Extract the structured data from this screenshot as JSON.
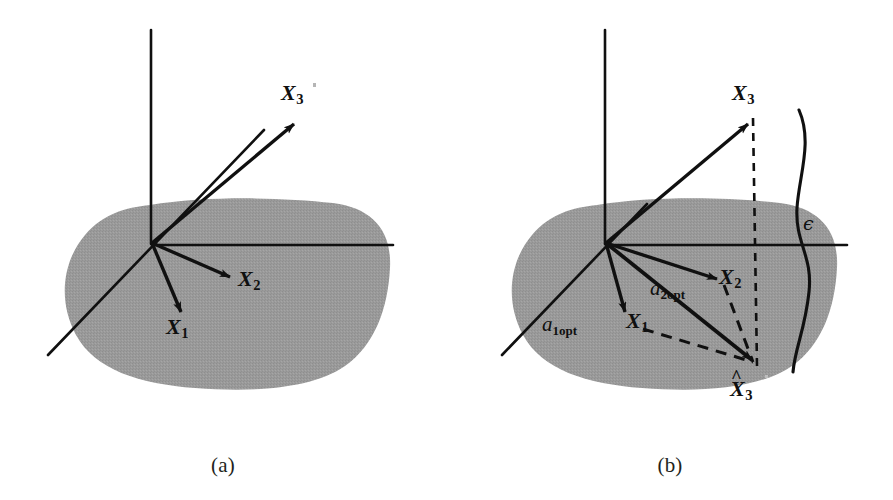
{
  "figure": {
    "background_color": "#ffffff",
    "ink_color": "#101010",
    "subspace_fill_color": "#9a9a9a"
  },
  "panels": [
    {
      "id": "a",
      "caption": "(a)",
      "labels": {
        "x1": "X",
        "x1_sub": "1",
        "x2": "X",
        "x2_sub": "2",
        "x3": "X",
        "x3_sub": "3"
      }
    },
    {
      "id": "b",
      "caption": "(b)",
      "labels": {
        "x1": "X",
        "x1_sub": "1",
        "x2": "X",
        "x2_sub": "2",
        "x3": "X",
        "x3_sub": "3",
        "x3_hat": "X",
        "x3_hat_sub": "3",
        "hat_glyph": "^",
        "a1_coef": "a",
        "a1_sub": "1opt",
        "a2_coef": "a",
        "a2_sub": "2opt",
        "epsilon": "ϵ"
      }
    }
  ],
  "geometry": {
    "panel_a": {
      "origin": [
        152,
        243
      ],
      "vertical_axis": [
        [
          151,
          30
        ],
        [
          151,
          243
        ]
      ],
      "horizontal_axis": [
        [
          152,
          245
        ],
        [
          393,
          245
        ]
      ],
      "diagonal_axis": [
        [
          48,
          355
        ],
        [
          262,
          132
        ]
      ],
      "vectors": [
        {
          "name": "X1",
          "from": [
            152,
            243
          ],
          "to": [
            183,
            318
          ]
        },
        {
          "name": "X2",
          "from": [
            152,
            243
          ],
          "to": [
            235,
            279
          ]
        },
        {
          "name": "X3",
          "from": [
            152,
            243
          ],
          "to": [
            298,
            120
          ]
        }
      ],
      "label_positions": {
        "X1": [
          172,
          328
        ],
        "X2": [
          241,
          282
        ],
        "X3": [
          283,
          88
        ]
      }
    },
    "panel_b": {
      "origin": [
        605,
        243
      ],
      "vertical_axis": [
        [
          604,
          30
        ],
        [
          604,
          243
        ]
      ],
      "horizontal_axis": [
        [
          605,
          245
        ],
        [
          846,
          245
        ]
      ],
      "diagonal_axis": [
        [
          501,
          355
        ],
        [
          700,
          148
        ]
      ],
      "vectors": [
        {
          "name": "X1",
          "from": [
            605,
            243
          ],
          "to": [
            625,
            318
          ]
        },
        {
          "name": "X2",
          "from": [
            605,
            243
          ],
          "to": [
            720,
            282
          ]
        },
        {
          "name": "X3",
          "from": [
            605,
            243
          ],
          "to": [
            751,
            120
          ]
        },
        {
          "name": "X3hat",
          "from": [
            605,
            243
          ],
          "to": [
            757,
            363
          ]
        }
      ],
      "dashed_lines": [
        {
          "name": "x3-to-x3hat-projection",
          "from": [
            753,
            118
          ],
          "to": [
            757,
            365
          ]
        },
        {
          "name": "a1-parallel-edge",
          "from": [
            645,
            329
          ],
          "to": [
            757,
            363
          ]
        },
        {
          "name": "a2-parallel-edge",
          "from": [
            722,
            285
          ],
          "to": [
            757,
            363
          ]
        }
      ],
      "label_positions": {
        "X1": [
          634,
          325
        ],
        "X2": [
          722,
          275
        ],
        "X3": [
          735,
          88
        ],
        "X3hat": [
          731,
          385
        ],
        "a1opt": [
          545,
          325
        ],
        "a2opt": [
          650,
          288
        ],
        "epsilon": [
          803,
          218
        ]
      },
      "epsilon_curve": [
        [
          799,
          110
        ],
        [
          814,
          160
        ],
        [
          800,
          215
        ],
        [
          812,
          270
        ],
        [
          803,
          330
        ],
        [
          793,
          370
        ]
      ]
    }
  }
}
